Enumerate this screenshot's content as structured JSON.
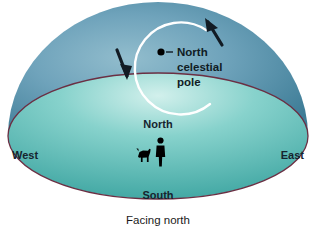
{
  "figure": {
    "caption": "Facing north",
    "pole_marker": {
      "label_line1": "North",
      "label_line2": "celestial",
      "label_line3": "pole",
      "dot_color": "#000000"
    },
    "directions": {
      "north": "North",
      "south": "South",
      "east": "East",
      "west": "West"
    },
    "colors": {
      "sky_light": "#8fb9cb",
      "sky_mid": "#5b93ab",
      "sky_dark": "#3c7d97",
      "ground_light": "#c9ece9",
      "ground_mid": "#6cc6c0",
      "ground_dark": "#3fa9a4",
      "horizon_line": "#6b2f43",
      "trail_arc": "#ffffff",
      "figure_silhouette": "#000000",
      "background": "#ffffff"
    },
    "icons": {
      "observer": "person-silhouette-icon",
      "dog": "dog-silhouette-icon",
      "rotation_left": "arrow-counterclockwise-left-icon",
      "rotation_right": "arrow-counterclockwise-right-icon",
      "pole_dot": "celestial-pole-dot-icon",
      "star_trail": "star-trail-arc-icon"
    }
  }
}
